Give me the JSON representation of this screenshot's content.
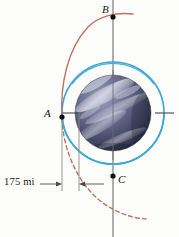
{
  "figure": {
    "background_color": "#fdfdfc",
    "points": [
      {
        "id": "B",
        "label": "B",
        "x": 113,
        "y": 17,
        "on": "vertical-axis",
        "note": "upper intersection of trajectory and axis"
      },
      {
        "id": "A",
        "label": "A",
        "x": 62,
        "y": 117,
        "on": "circular-orbit",
        "note": "left side, trajectory departure point"
      },
      {
        "id": "C",
        "label": "C",
        "x": 113,
        "y": 176,
        "on": "vertical-axis",
        "note": "bottom of circular orbit"
      }
    ],
    "dimension": {
      "label": "175 mi",
      "value": 175,
      "unit": "mi",
      "from_x": 62,
      "to_x": 79,
      "y": 184,
      "arrow_style": "double-ended"
    },
    "planet": {
      "name": "planet-sphere",
      "center_x": 113,
      "center_y": 113,
      "radius": 38,
      "base_color": "#5a5f80",
      "shadow_color": "#2b2e44",
      "highlight_color": "#c9ccdd",
      "band_color": "#8d93ad"
    },
    "circular_orbit": {
      "name": "circular-orbit",
      "color": "#3aa8d8",
      "center_x": 113,
      "center_y": 113,
      "radius": 51,
      "stroke_width": 1.6,
      "style": "solid"
    },
    "trajectory": {
      "name": "escape-trajectory",
      "color": "#c4705f",
      "stroke_width": 1.4,
      "solid_segment": "from A up through B and beyond",
      "dashed_segment": "from A down and to the right",
      "dash_pattern": "4 3"
    },
    "axis": {
      "name": "vertical-axis",
      "color": "#6e6e6e",
      "x": 113,
      "y_top": 0,
      "y_bottom": 237,
      "stroke_width": 1.1
    },
    "equator_ticks": {
      "color": "#4a4a4a",
      "left_x": 62,
      "right_x": 172,
      "y": 113
    },
    "extension_lines": {
      "color": "#8a8a8a",
      "lines": [
        {
          "x": 62,
          "y_top": 117,
          "y_bottom": 190
        },
        {
          "x": 79,
          "y_top": 112,
          "y_bottom": 190
        }
      ]
    }
  }
}
